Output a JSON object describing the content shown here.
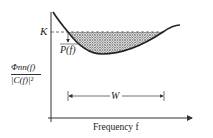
{
  "diagram": {
    "labels": {
      "water_level": "K",
      "power": "P(f)",
      "ylabel_num": "Φnn(f)",
      "ylabel_den": "|C(f)|²",
      "bandwidth": "W",
      "xlabel": "Frequency f"
    },
    "colors": {
      "curve": "#222222",
      "fill_pattern": "#555555",
      "axis": "#333333"
    }
  }
}
